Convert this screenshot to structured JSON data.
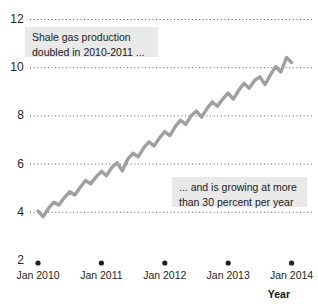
{
  "chart_data": {
    "type": "line",
    "title": "",
    "xlabel": "Year",
    "ylabel": "",
    "ylim": [
      2,
      12
    ],
    "xlim": [
      "Jan 2010",
      "Jan 2014"
    ],
    "grid": "horizontal-dotted",
    "legend": "none",
    "line_color": "#a0a0a0",
    "ytick_labels": [
      "12",
      "10",
      "8",
      "6",
      "4",
      "2"
    ],
    "ytick_values": [
      12,
      10,
      8,
      6,
      4,
      2
    ],
    "xtick_labels": [
      "Jan 2010",
      "Jan 2011",
      "Jan 2012",
      "Jan 2013",
      "Jan 2014"
    ],
    "xtick_values": [
      2010,
      2011,
      2012,
      2013,
      2014
    ],
    "series": [
      {
        "name": "Shale gas production",
        "x": [
          2010.0,
          2010.08,
          2010.17,
          2010.25,
          2010.33,
          2010.42,
          2010.5,
          2010.58,
          2010.67,
          2010.75,
          2010.83,
          2010.92,
          2011.0,
          2011.08,
          2011.17,
          2011.25,
          2011.33,
          2011.42,
          2011.5,
          2011.58,
          2011.67,
          2011.75,
          2011.83,
          2011.92,
          2012.0,
          2012.08,
          2012.17,
          2012.25,
          2012.33,
          2012.42,
          2012.5,
          2012.58,
          2012.67,
          2012.75,
          2012.83,
          2012.92,
          2013.0,
          2013.08,
          2013.17,
          2013.25,
          2013.33,
          2013.42,
          2013.5,
          2013.58,
          2013.67,
          2013.75,
          2013.83,
          2013.92,
          2014.0
        ],
        "values": [
          4.05,
          3.82,
          4.18,
          4.42,
          4.3,
          4.62,
          4.85,
          4.72,
          5.05,
          5.32,
          5.18,
          5.48,
          5.7,
          5.52,
          5.88,
          6.05,
          5.72,
          6.22,
          6.45,
          6.3,
          6.68,
          6.92,
          6.75,
          7.1,
          7.35,
          7.18,
          7.58,
          7.82,
          7.65,
          8.02,
          8.2,
          7.95,
          8.32,
          8.58,
          8.4,
          8.72,
          8.95,
          8.7,
          9.08,
          9.35,
          9.15,
          9.48,
          9.62,
          9.3,
          9.72,
          10.05,
          9.82,
          10.42,
          10.22
        ]
      }
    ],
    "annotations": [
      {
        "id": "callout-production-doubled",
        "lines": [
          "Shale gas production",
          "doubled in 2010-2011 ..."
        ],
        "x": 25,
        "y": 27,
        "width": 133,
        "height": 30
      },
      {
        "id": "callout-growth-rate",
        "lines": [
          "... and is growing at more",
          "than 30 percent per year"
        ],
        "x": 172,
        "y": 177,
        "width": 135,
        "height": 30
      }
    ]
  }
}
